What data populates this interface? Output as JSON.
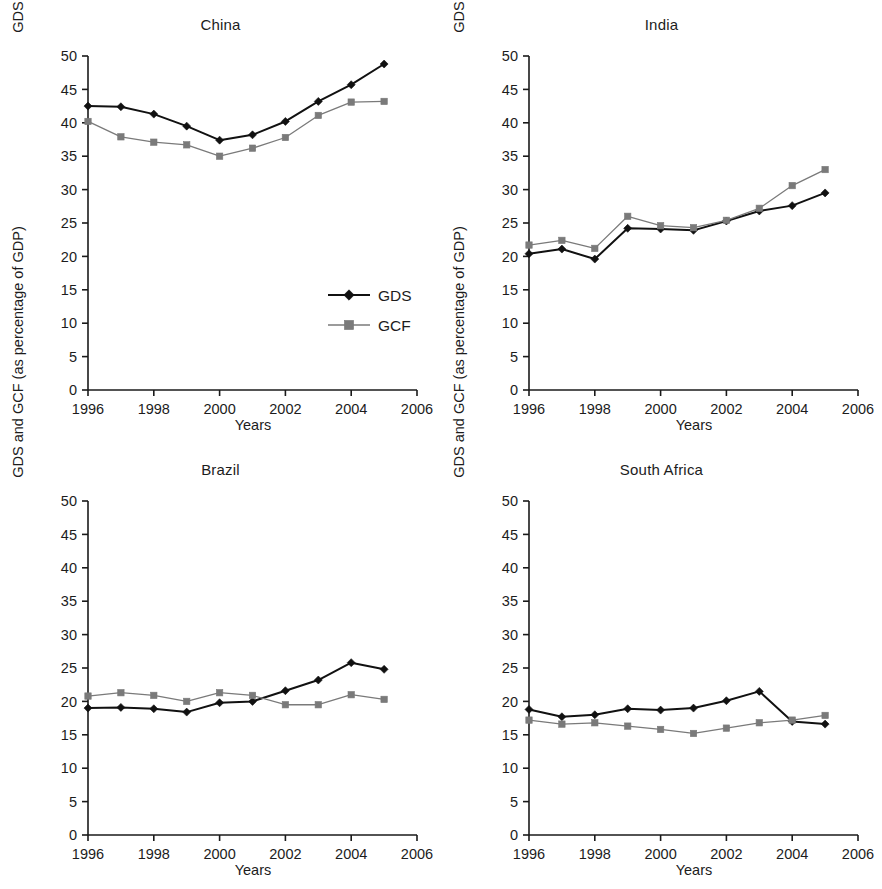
{
  "figure": {
    "axis_label_y": "GDS and GCF (as percentage of GDP)",
    "axis_label_x": "Years",
    "legend": {
      "gds_label": "GDS",
      "gcf_label": "GCF",
      "gds_color": "#111111",
      "gcf_color": "#7a7a7a",
      "position": "inside-china-panel-lower-right"
    },
    "y_ticks": [
      "0",
      "5",
      "10",
      "15",
      "20",
      "25",
      "30",
      "35",
      "40",
      "45",
      "50"
    ],
    "x_ticks": [
      "1996",
      "1998",
      "2000",
      "2002",
      "2004",
      "2006"
    ]
  },
  "chart_data": [
    {
      "type": "line",
      "title": "China",
      "xlabel": "Years",
      "ylabel": "GDS and GCF (as percentage of GDP)",
      "xlim": [
        1996,
        2006
      ],
      "ylim": [
        0,
        50
      ],
      "grid": false,
      "legend_position": "lower right",
      "x": [
        1996,
        1997,
        1998,
        1999,
        2000,
        2001,
        2002,
        2003,
        2004,
        2005
      ],
      "series": [
        {
          "name": "GDS",
          "values": [
            42.5,
            42.4,
            41.3,
            39.5,
            37.4,
            38.2,
            40.2,
            43.2,
            45.7,
            48.8
          ]
        },
        {
          "name": "GCF",
          "values": [
            40.2,
            37.9,
            37.1,
            36.7,
            35.0,
            36.2,
            37.8,
            41.1,
            43.1,
            43.2
          ]
        }
      ]
    },
    {
      "type": "line",
      "title": "India",
      "xlabel": "Years",
      "ylabel": "GDS and GCF (as percentage of GDP)",
      "xlim": [
        1996,
        2006
      ],
      "ylim": [
        0,
        50
      ],
      "grid": false,
      "legend_position": "none",
      "x": [
        1996,
        1997,
        1998,
        1999,
        2000,
        2001,
        2002,
        2003,
        2004,
        2005
      ],
      "series": [
        {
          "name": "GDS",
          "values": [
            20.4,
            21.1,
            19.6,
            24.2,
            24.1,
            23.9,
            25.3,
            26.8,
            27.6,
            29.5
          ]
        },
        {
          "name": "GCF",
          "values": [
            21.7,
            22.4,
            21.2,
            26.0,
            24.6,
            24.3,
            25.4,
            27.2,
            30.6,
            33.0
          ]
        }
      ]
    },
    {
      "type": "line",
      "title": "Brazil",
      "xlabel": "Years",
      "ylabel": "GDS and GCF (as percentage of GDP)",
      "xlim": [
        1996,
        2006
      ],
      "ylim": [
        0,
        50
      ],
      "grid": false,
      "legend_position": "none",
      "x": [
        1996,
        1997,
        1998,
        1999,
        2000,
        2001,
        2002,
        2003,
        2004,
        2005
      ],
      "series": [
        {
          "name": "GDS",
          "values": [
            19.0,
            19.1,
            18.9,
            18.4,
            19.8,
            20.0,
            21.6,
            23.2,
            25.8,
            24.8
          ]
        },
        {
          "name": "GCF",
          "values": [
            20.8,
            21.3,
            20.9,
            20.0,
            21.3,
            20.9,
            19.5,
            19.5,
            21.0,
            20.3
          ]
        }
      ]
    },
    {
      "type": "line",
      "title": "South Africa",
      "xlabel": "Years",
      "ylabel": "GDS and GCF (as percentage of GDP)",
      "xlim": [
        1996,
        2006
      ],
      "ylim": [
        0,
        50
      ],
      "grid": false,
      "legend_position": "none",
      "x": [
        1996,
        1997,
        1998,
        1999,
        2000,
        2001,
        2002,
        2003,
        2004,
        2005
      ],
      "series": [
        {
          "name": "GDS",
          "values": [
            18.8,
            17.7,
            18.0,
            18.9,
            18.7,
            19.0,
            20.1,
            21.5,
            17.0,
            16.6
          ]
        },
        {
          "name": "GCF",
          "values": [
            17.2,
            16.6,
            16.8,
            16.3,
            15.8,
            15.2,
            16.0,
            16.8,
            17.2,
            17.9
          ]
        }
      ]
    }
  ]
}
